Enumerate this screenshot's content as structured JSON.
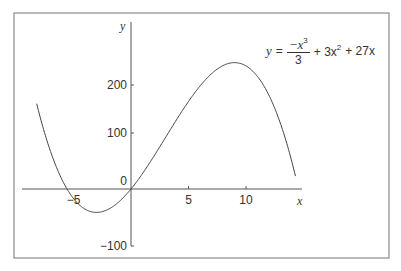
{
  "chart_data": {
    "type": "line",
    "title": "",
    "equation": {
      "lhs": "y",
      "equals": "=",
      "frac_num": "−x",
      "frac_num_exp": "3",
      "frac_den": "3",
      "term2": "+ 3x",
      "term2_exp": "2",
      "term3": "+ 27x"
    },
    "function": "y = -x^3/3 + 3x^2 + 27x",
    "xlabel": "x",
    "ylabel": "y",
    "xlim": [
      -8,
      14
    ],
    "ylim": [
      -100,
      250
    ],
    "x_ticks": [
      -5,
      5,
      10
    ],
    "x_tick_labels": [
      "−5",
      "5",
      "10"
    ],
    "y_ticks": [
      0,
      100,
      200,
      -100
    ],
    "y_tick_labels": [
      "0",
      "100",
      "200",
      "−100"
    ],
    "grid": false,
    "legend": null,
    "series": [
      {
        "name": "y = -x^3/3 + 3x^2 + 27x",
        "x": [
          -7.5,
          -7,
          -6,
          -5,
          -4,
          -3,
          -2,
          -1,
          0,
          1,
          2,
          3,
          4,
          5,
          6,
          7,
          8,
          9,
          10,
          11,
          12,
          13,
          13.5
        ],
        "values": [
          238.1,
          184.3,
          108,
          48.3,
          6.3,
          -18,
          -26.3,
          -23.7,
          0,
          29.7,
          63.3,
          99,
          134.7,
          168.3,
          198,
          221.7,
          237.3,
          243,
          236.7,
          216.3,
          180,
          125.7,
          90.0
        ]
      }
    ],
    "roots": [
      -5.2,
      0,
      14.2
    ]
  }
}
